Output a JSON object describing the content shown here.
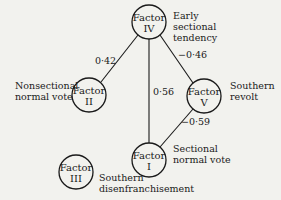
{
  "nodes": [
    {
      "id": "IV",
      "title": "Factor",
      "numeral": "IV",
      "description": [
        "Early",
        "sectional",
        "tendency"
      ]
    },
    {
      "id": "II",
      "title": "Factor",
      "numeral": "II",
      "description": [
        "Nonsectional",
        "normal vote"
      ]
    },
    {
      "id": "V",
      "title": "Factor",
      "numeral": "V",
      "description": [
        "Southern",
        "revolt"
      ]
    },
    {
      "id": "I",
      "title": "Factor",
      "numeral": "I",
      "description": [
        "Sectional",
        "normal vote"
      ]
    },
    {
      "id": "III",
      "title": "Factor",
      "numeral": "III",
      "description": [
        "Southern",
        "disenfranchisement"
      ]
    }
  ],
  "edges": [
    {
      "from": "IV",
      "to": "II",
      "weight": "0·42"
    },
    {
      "from": "IV",
      "to": "V",
      "weight": "−0·46"
    },
    {
      "from": "IV",
      "to": "I",
      "weight": "0·56"
    },
    {
      "from": "V",
      "to": "I",
      "weight": "−0·59"
    }
  ],
  "colors": {
    "background": "#f2f2ee",
    "ink": "#1a1a1a"
  }
}
